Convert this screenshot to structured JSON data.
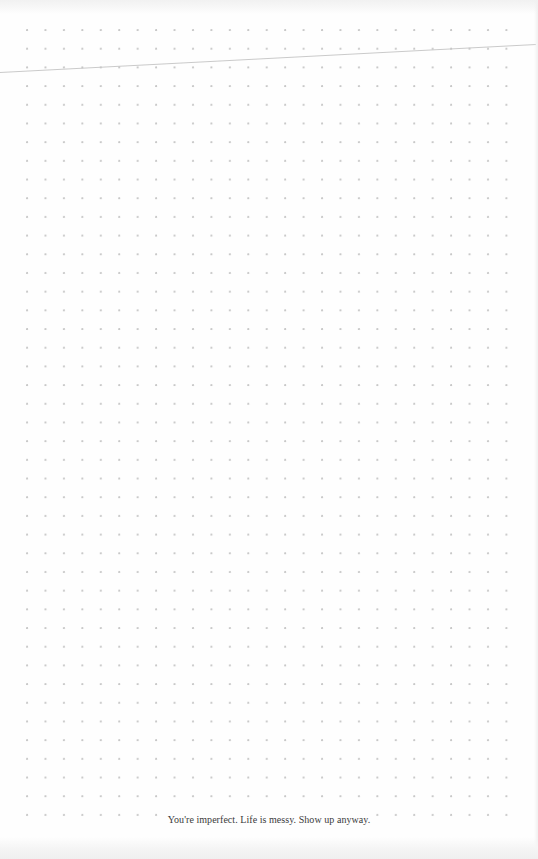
{
  "page": {
    "type": "dot-grid-notebook-page",
    "background_color": "#fefefe",
    "dot_color": "#c8c8c8",
    "line_color": "#c4c4c4"
  },
  "footer": {
    "quote": "You're imperfect. Life is messy. Show up anyway."
  }
}
